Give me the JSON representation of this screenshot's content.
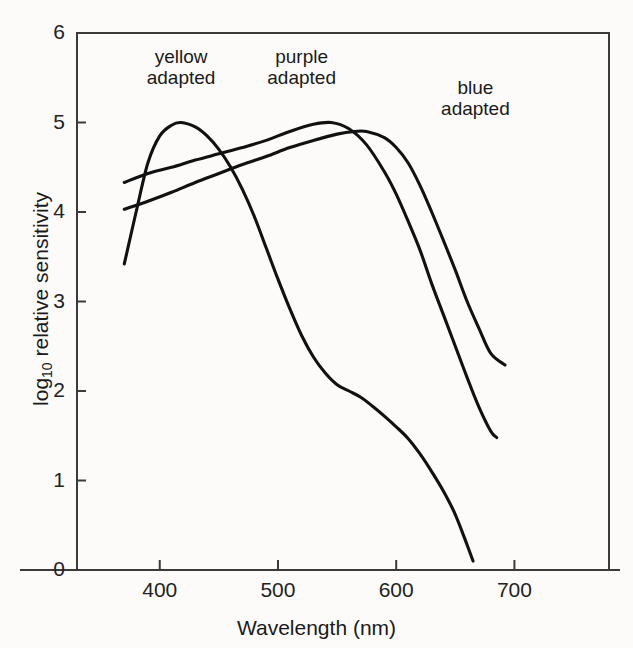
{
  "figure": {
    "background_color": "#fdfdfd",
    "line_color": "#111111",
    "axis_color": "#3a3a3a"
  },
  "chart_data": {
    "type": "line",
    "title": "",
    "xlabel": "Wavelength (nm)",
    "ylabel_main": "log",
    "ylabel_sub": "10",
    "ylabel_rest": " relative sensitivity",
    "ylabel": "log10 relative sensitivity",
    "xlim": [
      330,
      780
    ],
    "ylim": [
      0,
      6
    ],
    "xticks": [
      400,
      500,
      600,
      700
    ],
    "xtick_labels": [
      "400",
      "500",
      "600",
      "700"
    ],
    "yticks": [
      0,
      1,
      2,
      3,
      4,
      5,
      6
    ],
    "ytick_labels": [
      "0",
      "1",
      "2",
      "3",
      "4",
      "5",
      "6"
    ],
    "grid": false,
    "legend_position": "inline annotations",
    "annotations": [
      {
        "text": "yellow\nadapted",
        "x": 418,
        "y": 5.7
      },
      {
        "text": "purple\nadapted",
        "x": 520,
        "y": 5.7
      },
      {
        "text": "blue\nadapted",
        "x": 667,
        "y": 5.35
      }
    ],
    "series": [
      {
        "name": "yellow adapted",
        "x": [
          370,
          380,
          390,
          400,
          410,
          418,
          430,
          440,
          450,
          460,
          470,
          480,
          490,
          500,
          510,
          520,
          530,
          540,
          550,
          560,
          570,
          580,
          590,
          600,
          610,
          620,
          630,
          640,
          650,
          660,
          665
        ],
        "values": [
          3.42,
          4.0,
          4.55,
          4.85,
          4.97,
          5.0,
          4.95,
          4.85,
          4.7,
          4.5,
          4.25,
          3.95,
          3.6,
          3.25,
          2.92,
          2.62,
          2.38,
          2.2,
          2.07,
          2.0,
          1.93,
          1.83,
          1.72,
          1.6,
          1.47,
          1.3,
          1.1,
          0.88,
          0.62,
          0.28,
          0.1
        ]
      },
      {
        "name": "purple adapted",
        "x": [
          370,
          390,
          410,
          430,
          450,
          470,
          490,
          510,
          530,
          545,
          560,
          575,
          590,
          600,
          610,
          620,
          630,
          640,
          650,
          660,
          670,
          680,
          685
        ],
        "values": [
          4.33,
          4.43,
          4.5,
          4.58,
          4.65,
          4.72,
          4.8,
          4.9,
          4.98,
          5.0,
          4.93,
          4.75,
          4.45,
          4.2,
          3.9,
          3.58,
          3.2,
          2.85,
          2.5,
          2.15,
          1.82,
          1.55,
          1.48
        ]
      },
      {
        "name": "blue adapted",
        "x": [
          370,
          390,
          410,
          430,
          450,
          470,
          490,
          510,
          530,
          550,
          565,
          575,
          590,
          600,
          610,
          620,
          630,
          640,
          650,
          660,
          670,
          680,
          692
        ],
        "values": [
          4.03,
          4.12,
          4.22,
          4.33,
          4.43,
          4.53,
          4.62,
          4.72,
          4.8,
          4.87,
          4.9,
          4.9,
          4.83,
          4.72,
          4.55,
          4.3,
          4.0,
          3.68,
          3.35,
          3.0,
          2.7,
          2.42,
          2.29
        ]
      }
    ]
  },
  "axis_titles": {
    "x": "Wavelength (nm)"
  }
}
